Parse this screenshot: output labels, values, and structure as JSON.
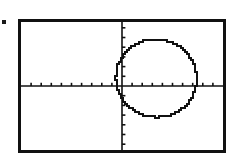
{
  "screen": {
    "device": "graphing-calculator-screen",
    "background_color": "#ffffff",
    "frame_color": "#111111",
    "ink_color": "#111111",
    "width_px": 236,
    "height_px": 160
  },
  "margin_marker": {
    "name": "bullet-dot",
    "color": "#1a1a1a"
  },
  "chart_data": {
    "type": "scatter",
    "title": "",
    "subtitle": "",
    "xlabel": "",
    "ylabel": "",
    "grid": false,
    "legend_position": "none",
    "axes": {
      "x_axis_visible": true,
      "y_axis_visible": true,
      "x_axis_y_value": 0,
      "y_axis_x_value": 0,
      "tick_marks": true,
      "tick_direction_x": "up",
      "tick_direction_y": "right",
      "x_tick_spacing": 1,
      "y_tick_spacing": 1,
      "x_tick_count": 20,
      "y_tick_count": 14,
      "xlim": [
        -10,
        10
      ],
      "ylim": [
        -6.6,
        6.6
      ]
    },
    "series": [
      {
        "name": "circle",
        "type": "implicit-curve",
        "equation": "(x - 3.4)^2 + (y - 0.8)^2 = 4^2",
        "center": [
          3.4,
          0.8
        ],
        "radius": 4,
        "stroke_color": "#111111",
        "stroke_width": 2,
        "rendering": "pixelated"
      }
    ],
    "annotations": []
  }
}
